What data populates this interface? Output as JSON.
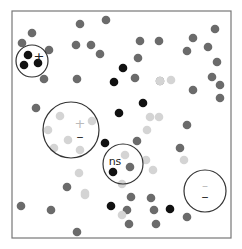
{
  "diagram": {
    "frame": {
      "x": 12,
      "y": 11,
      "width": 219,
      "height": 227,
      "stroke": "#777777"
    },
    "colors": {
      "black": "#111111",
      "dark_gray": "#6b6b6b",
      "light_gray": "#d4d4d4",
      "circle_stroke": "#333333"
    },
    "circles": [
      {
        "id": "plus-cluster",
        "cx": 32,
        "cy": 61,
        "r": 16,
        "labels": [
          {
            "text": "+",
            "x": 39,
            "y": 57,
            "size": 13,
            "color": "#222222"
          }
        ]
      },
      {
        "id": "plus-minus-cluster",
        "cx": 71,
        "cy": 130,
        "r": 28,
        "labels": [
          {
            "text": "+",
            "x": 80,
            "y": 124,
            "size": 13,
            "color": "#bbbbbb"
          },
          {
            "text": "–",
            "x": 80,
            "y": 137,
            "size": 14,
            "color": "#333333"
          }
        ]
      },
      {
        "id": "ns-cluster",
        "cx": 123,
        "cy": 164,
        "r": 20,
        "labels": [
          {
            "text": "ns",
            "x": 115,
            "y": 162,
            "size": 11,
            "color": "#222222"
          }
        ]
      },
      {
        "id": "minus-cluster",
        "cx": 205,
        "cy": 191,
        "r": 21,
        "labels": [
          {
            "text": "–",
            "x": 205,
            "y": 186,
            "size": 12,
            "color": "#bbbbbb"
          },
          {
            "text": "–",
            "x": 205,
            "y": 197,
            "size": 14,
            "color": "#333333"
          }
        ]
      }
    ],
    "dots": [
      {
        "x": 28,
        "y": 55,
        "c": "black"
      },
      {
        "x": 24,
        "y": 65,
        "c": "black"
      },
      {
        "x": 38,
        "y": 63,
        "c": "black"
      },
      {
        "x": 32,
        "y": 33,
        "c": "dark_gray"
      },
      {
        "x": 22,
        "y": 43,
        "c": "dark_gray"
      },
      {
        "x": 49,
        "y": 50,
        "c": "dark_gray"
      },
      {
        "x": 44,
        "y": 79,
        "c": "dark_gray"
      },
      {
        "x": 80,
        "y": 24,
        "c": "dark_gray"
      },
      {
        "x": 106,
        "y": 20,
        "c": "dark_gray"
      },
      {
        "x": 76,
        "y": 45,
        "c": "dark_gray"
      },
      {
        "x": 91,
        "y": 45,
        "c": "dark_gray"
      },
      {
        "x": 100,
        "y": 54,
        "c": "dark_gray"
      },
      {
        "x": 77,
        "y": 79,
        "c": "dark_gray"
      },
      {
        "x": 140,
        "y": 41,
        "c": "dark_gray"
      },
      {
        "x": 159,
        "y": 41,
        "c": "dark_gray"
      },
      {
        "x": 138,
        "y": 58,
        "c": "dark_gray"
      },
      {
        "x": 135,
        "y": 78,
        "c": "dark_gray"
      },
      {
        "x": 160,
        "y": 81,
        "c": "dark_gray"
      },
      {
        "x": 193,
        "y": 38,
        "c": "dark_gray"
      },
      {
        "x": 187,
        "y": 51,
        "c": "dark_gray"
      },
      {
        "x": 215,
        "y": 29,
        "c": "dark_gray"
      },
      {
        "x": 208,
        "y": 47,
        "c": "dark_gray"
      },
      {
        "x": 217,
        "y": 62,
        "c": "dark_gray"
      },
      {
        "x": 212,
        "y": 77,
        "c": "dark_gray"
      },
      {
        "x": 220,
        "y": 85,
        "c": "dark_gray"
      },
      {
        "x": 220,
        "y": 98,
        "c": "dark_gray"
      },
      {
        "x": 193,
        "y": 90,
        "c": "dark_gray"
      },
      {
        "x": 36,
        "y": 108,
        "c": "dark_gray"
      },
      {
        "x": 187,
        "y": 125,
        "c": "dark_gray"
      },
      {
        "x": 180,
        "y": 148,
        "c": "dark_gray"
      },
      {
        "x": 137,
        "y": 141,
        "c": "dark_gray"
      },
      {
        "x": 130,
        "y": 167,
        "c": "dark_gray"
      },
      {
        "x": 67,
        "y": 187,
        "c": "dark_gray"
      },
      {
        "x": 21,
        "y": 206,
        "c": "dark_gray"
      },
      {
        "x": 51,
        "y": 210,
        "c": "dark_gray"
      },
      {
        "x": 131,
        "y": 197,
        "c": "dark_gray"
      },
      {
        "x": 127,
        "y": 210,
        "c": "dark_gray"
      },
      {
        "x": 77,
        "y": 232,
        "c": "dark_gray"
      },
      {
        "x": 151,
        "y": 198,
        "c": "dark_gray"
      },
      {
        "x": 154,
        "y": 210,
        "c": "dark_gray"
      },
      {
        "x": 129,
        "y": 224,
        "c": "dark_gray"
      },
      {
        "x": 156,
        "y": 224,
        "c": "dark_gray"
      },
      {
        "x": 187,
        "y": 217,
        "c": "dark_gray"
      },
      {
        "x": 123,
        "y": 68,
        "c": "black"
      },
      {
        "x": 114,
        "y": 82,
        "c": "black"
      },
      {
        "x": 143,
        "y": 103,
        "c": "black"
      },
      {
        "x": 119,
        "y": 113,
        "c": "black"
      },
      {
        "x": 105,
        "y": 143,
        "c": "black"
      },
      {
        "x": 113,
        "y": 172,
        "c": "black"
      },
      {
        "x": 111,
        "y": 206,
        "c": "black"
      },
      {
        "x": 170,
        "y": 209,
        "c": "black"
      },
      {
        "x": 160,
        "y": 81,
        "c": "light_gray"
      },
      {
        "x": 171,
        "y": 80,
        "c": "light_gray"
      },
      {
        "x": 159,
        "y": 117,
        "c": "light_gray"
      },
      {
        "x": 147,
        "y": 130,
        "c": "light_gray"
      },
      {
        "x": 146,
        "y": 160,
        "c": "light_gray"
      },
      {
        "x": 60,
        "y": 116,
        "c": "light_gray"
      },
      {
        "x": 92,
        "y": 121,
        "c": "light_gray"
      },
      {
        "x": 48,
        "y": 130,
        "c": "light_gray"
      },
      {
        "x": 68,
        "y": 140,
        "c": "light_gray"
      },
      {
        "x": 54,
        "y": 148,
        "c": "light_gray"
      },
      {
        "x": 80,
        "y": 150,
        "c": "light_gray"
      },
      {
        "x": 79,
        "y": 173,
        "c": "light_gray"
      },
      {
        "x": 85,
        "y": 193,
        "c": "light_gray"
      },
      {
        "x": 85,
        "y": 195,
        "c": "light_gray"
      },
      {
        "x": 125,
        "y": 155,
        "c": "light_gray"
      },
      {
        "x": 153,
        "y": 170,
        "c": "light_gray"
      },
      {
        "x": 184,
        "y": 160,
        "c": "light_gray"
      },
      {
        "x": 122,
        "y": 184,
        "c": "light_gray"
      },
      {
        "x": 122,
        "y": 215,
        "c": "light_gray"
      },
      {
        "x": 150,
        "y": 117,
        "c": "light_gray"
      }
    ]
  }
}
